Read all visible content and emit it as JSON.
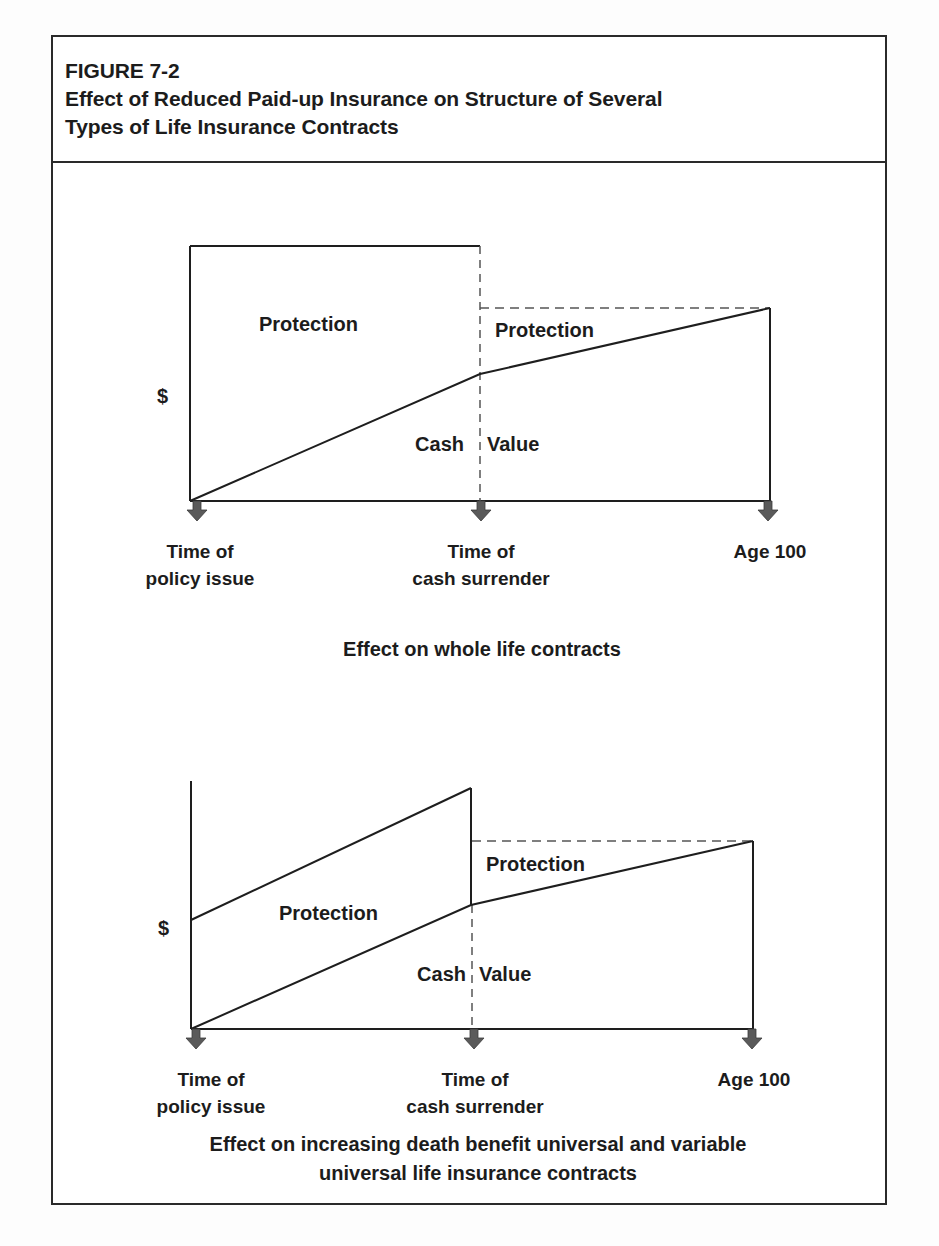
{
  "figure": {
    "number": "FIGURE 7-2",
    "title_line1": "Effect of Reduced Paid-up Insurance on Structure of Several",
    "title_line2": "Types of Life Insurance Contracts"
  },
  "colors": {
    "line": "#1e1e1e",
    "dashed": "#555555",
    "arrow": "#5a5a5a",
    "border": "#2a2a2a",
    "text": "#1c1c1c"
  },
  "diagrams": [
    {
      "id": "whole-life",
      "caption_lines": [
        "Effect on whole life contracts"
      ],
      "y_axis_label": "$",
      "regions": {
        "protection_before": "Protection",
        "protection_after": "Protection",
        "cash": "Cash",
        "value": "Value"
      },
      "x_markers": [
        {
          "line1": "Time of",
          "line2": "policy issue"
        },
        {
          "line1": "Time of",
          "line2": "cash surrender"
        },
        {
          "line1": "Age 100",
          "line2": ""
        }
      ]
    },
    {
      "id": "increasing-death-benefit-ul",
      "caption_lines": [
        "Effect on increasing death benefit universal and variable",
        "universal life insurance contracts"
      ],
      "y_axis_label": "$",
      "regions": {
        "protection_before": "Protection",
        "protection_after": "Protection",
        "cash": "Cash",
        "value": "Value"
      },
      "x_markers": [
        {
          "line1": "Time of",
          "line2": "policy issue"
        },
        {
          "line1": "Time of",
          "line2": "cash surrender"
        },
        {
          "line1": "Age 100",
          "line2": ""
        }
      ]
    }
  ]
}
